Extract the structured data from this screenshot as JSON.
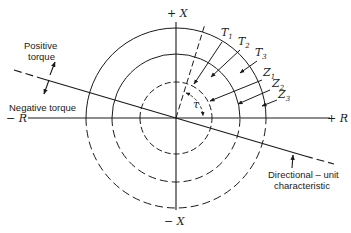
{
  "diagram": {
    "axes": {
      "plus_x": "+ X",
      "minus_x": "− X",
      "plus_r": "+ R",
      "minus_r": "− R"
    },
    "torque_labels": {
      "positive": [
        "Positive",
        "torque"
      ],
      "negative": "Negative torque"
    },
    "angle_label": "τ",
    "curves": [
      {
        "id": "T1",
        "letter": "T",
        "sub": "1"
      },
      {
        "id": "T2",
        "letter": "T",
        "sub": "2"
      },
      {
        "id": "T3",
        "letter": "T",
        "sub": "3"
      },
      {
        "id": "Z1",
        "letter": "Z",
        "sub": "1"
      },
      {
        "id": "Z2",
        "letter": "Z",
        "sub": "2"
      },
      {
        "id": "Z3",
        "letter": "Z",
        "sub": "3"
      }
    ],
    "directional_label": [
      "Directional – unit",
      "characteristic"
    ],
    "colors": {
      "ink": "#1a1a1a",
      "background": "#ffffff"
    }
  }
}
